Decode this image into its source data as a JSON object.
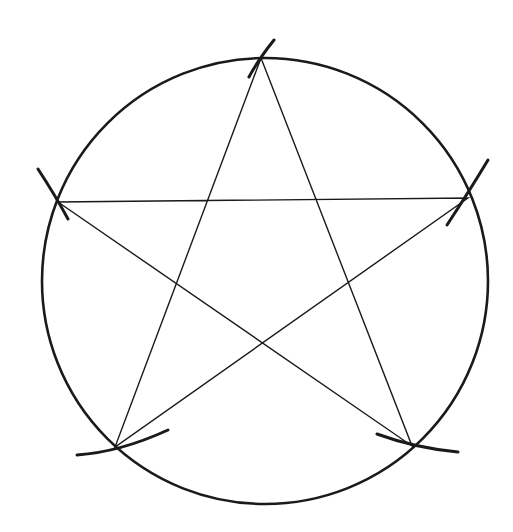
{
  "diagram": {
    "stroke_color": "#1a1a1a",
    "background": "#ffffff",
    "circle": {
      "cx": 265,
      "cy": 281,
      "r": 223
    },
    "vertices": [
      {
        "name": "top",
        "x": 261,
        "y": 58
      },
      {
        "name": "right",
        "x": 468,
        "y": 198
      },
      {
        "name": "bottom-right",
        "x": 412,
        "y": 446
      },
      {
        "name": "bottom-left",
        "x": 115,
        "y": 447
      },
      {
        "name": "left",
        "x": 58,
        "y": 202
      }
    ],
    "star_order": [
      "top",
      "bottom-right",
      "left",
      "right",
      "bottom-left"
    ],
    "compass_arcs": [
      {
        "at": "top",
        "d": "M 249 77 Q 258 60 274 40"
      },
      {
        "at": "left",
        "d": "M 38 169 Q 55 195 68 219"
      },
      {
        "at": "right",
        "d": "M 488 160 Q 470 190 447 225"
      },
      {
        "at": "bottom-left",
        "d": "M 77 455 Q 120 452 168 430"
      },
      {
        "at": "bottom-right",
        "d": "M 377 434 Q 415 448 458 452"
      }
    ]
  }
}
